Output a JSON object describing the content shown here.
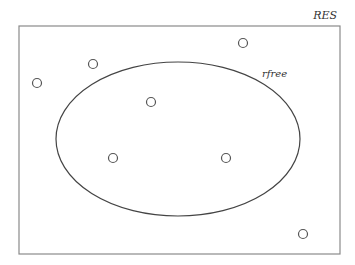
{
  "diagram": {
    "type": "venn-set",
    "outer_set": {
      "label": "RES",
      "rect": {
        "x": 19,
        "y": 26,
        "width": 321,
        "height": 228
      },
      "stroke": "#8a8a8a"
    },
    "inner_set": {
      "label": "rfree",
      "ellipse": {
        "cx": 178,
        "cy": 139,
        "rx": 122,
        "ry": 77
      },
      "stroke": "#444444"
    },
    "points": [
      {
        "id": "p1",
        "x": 37,
        "y": 83,
        "inside": false
      },
      {
        "id": "p2",
        "x": 93,
        "y": 64,
        "inside": false
      },
      {
        "id": "p3",
        "x": 243,
        "y": 43,
        "inside": false
      },
      {
        "id": "p4",
        "x": 151,
        "y": 102,
        "inside": true
      },
      {
        "id": "p5",
        "x": 113,
        "y": 158,
        "inside": true
      },
      {
        "id": "p6",
        "x": 226,
        "y": 158,
        "inside": true
      },
      {
        "id": "p7",
        "x": 303,
        "y": 234,
        "inside": false
      }
    ],
    "point_radius": 4.5,
    "point_stroke": "#555555"
  }
}
